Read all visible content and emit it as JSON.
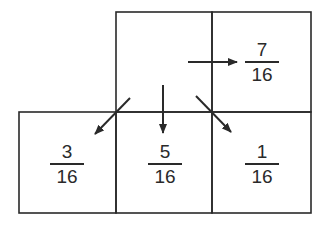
{
  "diagram": {
    "type": "Floyd-Steinberg error diffusion kernel",
    "stroke_color": "#2a2a2a",
    "cells": {
      "right": {
        "numerator": "7",
        "denominator": "16"
      },
      "bottom_left": {
        "numerator": "3",
        "denominator": "16"
      },
      "bottom": {
        "numerator": "5",
        "denominator": "16"
      },
      "bottom_right": {
        "numerator": "1",
        "denominator": "16"
      }
    },
    "arrows": [
      {
        "name": "right",
        "target": "7/16"
      },
      {
        "name": "down-left",
        "target": "3/16"
      },
      {
        "name": "down",
        "target": "5/16"
      },
      {
        "name": "down-right",
        "target": "1/16"
      }
    ]
  }
}
